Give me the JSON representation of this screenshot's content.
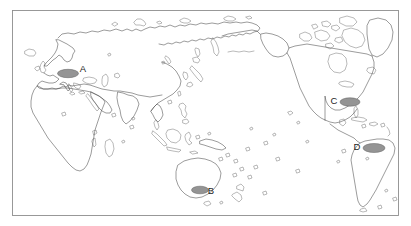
{
  "figure": {
    "type": "world-map",
    "projection_note": "Pacific-centered world map outline",
    "background_color": "#ffffff",
    "frame_color": "#8e8e8e",
    "coastline_color": "#4a4a4a",
    "marker_fill_color": "#949494",
    "marker_outline_color": "#5f5f5f",
    "label_color": "#1d1d1d"
  },
  "frame": {
    "x": 12,
    "y": 10,
    "width": 387,
    "height": 206
  },
  "markers": [
    {
      "label": "A",
      "region": "Europe",
      "cx": 68,
      "cy": 73.5,
      "rx": 10.5,
      "ry": 4.2,
      "label_x": 83,
      "label_y": 69
    },
    {
      "label": "B",
      "region": "Australia",
      "cx": 200,
      "cy": 190,
      "rx": 8.5,
      "ry": 3.8,
      "label_x": 211,
      "label_y": 191
    },
    {
      "label": "C",
      "region": "Southeastern North America",
      "cx": 350,
      "cy": 102,
      "rx": 10,
      "ry": 4.2,
      "label_x": 334,
      "label_y": 101
    },
    {
      "label": "D",
      "region": "Northern South America",
      "cx": 374,
      "cy": 148,
      "rx": 11,
      "ry": 4.5,
      "label_x": 357,
      "label_y": 147
    }
  ],
  "marker_labels": {
    "a": "A",
    "b": "B",
    "c": "C",
    "d": "D"
  }
}
